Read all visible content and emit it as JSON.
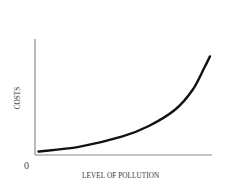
{
  "chart_data": {
    "type": "line",
    "title": "",
    "xlabel": "LEVEL OF POLLUTION",
    "ylabel": "COSTS",
    "origin_label": "0",
    "grid": false,
    "legend": null,
    "x_ticks": [],
    "y_ticks": [],
    "series": [
      {
        "name": "Costs",
        "description": "Convex, increasing cost curve that rises slowly at low pollution levels and steeply at high pollution levels",
        "x": [
          0.02,
          0.25,
          0.5,
          0.65,
          0.8,
          0.9,
          0.97,
          1.0
        ],
        "y": [
          0.03,
          0.07,
          0.16,
          0.25,
          0.39,
          0.56,
          0.76,
          0.85
        ]
      }
    ],
    "xlim": [
      0,
      1
    ],
    "ylim": [
      0,
      1
    ]
  },
  "colors": {
    "curve": "#111111",
    "axes": "#8a8a8a",
    "text": "#333333",
    "background": "#ffffff"
  }
}
